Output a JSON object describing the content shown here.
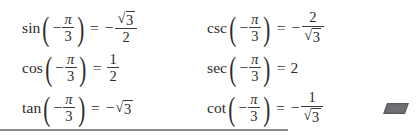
{
  "page": {
    "background_color": "#ffffff",
    "text_color": "#2b2b2b",
    "rule_color": "#8a8a90",
    "slab_color": "#5a5a5f"
  },
  "equations": {
    "columns": [
      {
        "name": "left-column",
        "rows": [
          {
            "function": "sin",
            "open_paren": "(",
            "arg_sign": "−",
            "arg_numerator": "π",
            "arg_denominator": "3",
            "close_paren": ")",
            "equals": "=",
            "result_sign": "−",
            "result_type": "fraction-radical",
            "result_numerator": "3",
            "result_denominator": "2",
            "result_text": "−√3/2"
          },
          {
            "function": "cos",
            "open_paren": "(",
            "arg_sign": "−",
            "arg_numerator": "π",
            "arg_denominator": "3",
            "close_paren": ")",
            "equals": "=",
            "result_sign": "",
            "result_type": "fraction",
            "result_numerator": "1",
            "result_denominator": "2",
            "result_text": "1/2"
          },
          {
            "function": "tan",
            "open_paren": "(",
            "arg_sign": "−",
            "arg_numerator": "π",
            "arg_denominator": "3",
            "close_paren": ")",
            "equals": "=",
            "result_sign": "−",
            "result_type": "radical",
            "result_radicand": "3",
            "result_text": "−√3"
          }
        ]
      },
      {
        "name": "right-column",
        "rows": [
          {
            "function": "csc",
            "open_paren": "(",
            "arg_sign": "−",
            "arg_numerator": "π",
            "arg_denominator": "3",
            "close_paren": ")",
            "equals": "=",
            "result_sign": "−",
            "result_type": "fraction-radical-denominator",
            "result_numerator": "2",
            "result_denominator": "3",
            "result_text": "−2/√3"
          },
          {
            "function": "sec",
            "open_paren": "(",
            "arg_sign": "−",
            "arg_numerator": "π",
            "arg_denominator": "3",
            "close_paren": ")",
            "equals": "=",
            "result_sign": "",
            "result_type": "integer",
            "result_value": "2",
            "result_text": "2"
          },
          {
            "function": "cot",
            "open_paren": "(",
            "arg_sign": "−",
            "arg_numerator": "π",
            "arg_denominator": "3",
            "close_paren": ")",
            "equals": "=",
            "result_sign": "−",
            "result_type": "fraction-radical-denominator",
            "result_numerator": "1",
            "result_denominator": "3",
            "result_text": "−1/√3"
          }
        ]
      }
    ]
  },
  "decorations": {
    "radical_glyph": "√",
    "bottom_rule": "horizontal-rule",
    "slab_marker": "gray-parallelogram"
  }
}
